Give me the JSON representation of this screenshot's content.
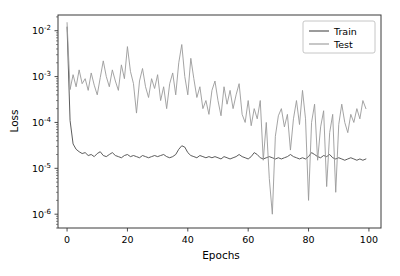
{
  "figure": {
    "background_color": "#ffffff",
    "plot_area": {
      "left": 58,
      "top": 15,
      "right": 381,
      "bottom": 228
    }
  },
  "chart_data": {
    "type": "line",
    "title": "",
    "xlabel": "Epochs",
    "ylabel": "Loss",
    "yscale": "log",
    "xscale": "linear",
    "xlim": [
      -3,
      104
    ],
    "ylim": [
      5e-07,
      0.022
    ],
    "grid": false,
    "legend_position": "upper right",
    "xticks": [
      0,
      20,
      40,
      60,
      80,
      100
    ],
    "xtick_labels": [
      "0",
      "20",
      "40",
      "60",
      "80",
      "100"
    ],
    "yticks": [
      0.01,
      0.001,
      0.0001,
      1e-05,
      1e-06
    ],
    "ytick_labels": [
      "10−2",
      "10−3",
      "10−4",
      "10−5",
      "10−6"
    ],
    "ytick_mantissas": [
      "10",
      "10",
      "10",
      "10",
      "10"
    ],
    "ytick_exponents": [
      "-2",
      "-3",
      "-4",
      "-5",
      "-6"
    ],
    "series": [
      {
        "name": "Train",
        "color": "#4a4a4a",
        "linewidth": 0.9,
        "x": [
          0,
          1,
          2,
          3,
          4,
          5,
          6,
          7,
          8,
          9,
          10,
          11,
          12,
          13,
          14,
          15,
          16,
          17,
          18,
          19,
          20,
          21,
          22,
          23,
          24,
          25,
          26,
          27,
          28,
          29,
          30,
          31,
          32,
          33,
          34,
          35,
          36,
          37,
          38,
          39,
          40,
          41,
          42,
          43,
          44,
          45,
          46,
          47,
          48,
          49,
          50,
          51,
          52,
          53,
          54,
          55,
          56,
          57,
          58,
          59,
          60,
          61,
          62,
          63,
          64,
          65,
          66,
          67,
          68,
          69,
          70,
          71,
          72,
          73,
          74,
          75,
          76,
          77,
          78,
          79,
          80,
          81,
          82,
          83,
          84,
          85,
          86,
          87,
          88,
          89,
          90,
          91,
          92,
          93,
          94,
          95,
          96,
          97,
          98,
          99
        ],
        "values": [
          0.012,
          0.00011,
          3.4e-05,
          2.6e-05,
          2.3e-05,
          2.1e-05,
          2.2e-05,
          1.9e-05,
          2e-05,
          1.8e-05,
          2.1e-05,
          2.3e-05,
          1.9e-05,
          1.8e-05,
          2e-05,
          2.2e-05,
          1.9e-05,
          1.8e-05,
          1.7e-05,
          1.9e-05,
          2e-05,
          1.8e-05,
          1.9e-05,
          1.8e-05,
          1.7e-05,
          1.9e-05,
          1.8e-05,
          1.7e-05,
          1.8e-05,
          1.9e-05,
          1.8e-05,
          1.9e-05,
          2e-05,
          1.8e-05,
          1.7e-05,
          1.8e-05,
          2e-05,
          2.6e-05,
          3.1e-05,
          2.9e-05,
          2.2e-05,
          1.9e-05,
          1.8e-05,
          1.7e-05,
          1.9e-05,
          1.8e-05,
          1.7e-05,
          1.8e-05,
          1.7e-05,
          1.8e-05,
          1.7e-05,
          1.6e-05,
          1.8e-05,
          1.7e-05,
          1.6e-05,
          1.7e-05,
          1.8e-05,
          2e-05,
          1.8e-05,
          1.7e-05,
          1.6e-05,
          1.8e-05,
          2.2e-05,
          2e-05,
          1.7e-05,
          1.6e-05,
          1.7e-05,
          1.8e-05,
          1.7e-05,
          1.6e-05,
          1.7e-05,
          1.6e-05,
          1.7e-05,
          1.8e-05,
          2e-05,
          1.8e-05,
          1.7e-05,
          1.6e-05,
          1.7e-05,
          1.6e-05,
          1.8e-05,
          2.2e-05,
          2e-05,
          1.8e-05,
          1.7e-05,
          1.9e-05,
          1.8e-05,
          2e-05,
          1.7e-05,
          1.6e-05,
          1.7e-05,
          1.6e-05,
          1.5e-05,
          1.6e-05,
          1.7e-05,
          1.6e-05,
          1.5e-05,
          1.6e-05,
          1.5e-05,
          1.6e-05
        ]
      },
      {
        "name": "Test",
        "color": "#9a9a9a",
        "linewidth": 0.9,
        "x": [
          0,
          1,
          2,
          3,
          4,
          5,
          6,
          7,
          8,
          9,
          10,
          11,
          12,
          13,
          14,
          15,
          16,
          17,
          18,
          19,
          20,
          21,
          22,
          23,
          24,
          25,
          26,
          27,
          28,
          29,
          30,
          31,
          32,
          33,
          34,
          35,
          36,
          37,
          38,
          39,
          40,
          41,
          42,
          43,
          44,
          45,
          46,
          47,
          48,
          49,
          50,
          51,
          52,
          53,
          54,
          55,
          56,
          57,
          58,
          59,
          60,
          61,
          62,
          63,
          64,
          65,
          66,
          67,
          68,
          69,
          70,
          71,
          72,
          73,
          74,
          75,
          76,
          77,
          78,
          79,
          80,
          81,
          82,
          83,
          84,
          85,
          86,
          87,
          88,
          89,
          90,
          91,
          92,
          93,
          94,
          95,
          96,
          97,
          98,
          99
        ],
        "values": [
          0.015,
          0.00052,
          0.0011,
          0.0006,
          0.0014,
          0.0007,
          0.0009,
          0.0005,
          0.0012,
          0.00065,
          0.0004,
          0.00095,
          0.0022,
          0.001,
          0.0006,
          0.0014,
          0.0008,
          0.0005,
          0.0018,
          0.0009,
          0.0045,
          0.0013,
          0.0007,
          0.00016,
          0.0008,
          0.0015,
          0.0006,
          0.00035,
          0.0009,
          0.00055,
          0.0011,
          0.0003,
          0.0006,
          0.0002,
          0.0007,
          0.0012,
          0.0004,
          0.002,
          0.005,
          0.001,
          0.0004,
          0.0025,
          0.0009,
          0.00035,
          0.0006,
          0.0002,
          0.0003,
          0.00015,
          0.0005,
          0.0008,
          0.0003,
          0.00014,
          0.0006,
          0.00025,
          0.0005,
          0.0002,
          0.0004,
          0.0007,
          0.00015,
          0.0001,
          0.0003,
          8.5e-05,
          0.0002,
          0.00012,
          0.0003,
          1.5e-05,
          0.0001,
          6e-06,
          1e-06,
          5e-05,
          0.00014,
          0.0002,
          8e-05,
          0.00015,
          2.5e-05,
          0.00012,
          0.0003,
          9e-05,
          0.0005,
          0.00012,
          2e-06,
          0.0001,
          0.00025,
          1.5e-05,
          8e-05,
          0.00018,
          4e-06,
          6e-05,
          0.00015,
          3e-06,
          9e-05,
          0.00025,
          0.0001,
          6e-05,
          0.00015,
          0.0001,
          0.0002,
          0.00012,
          0.0003,
          0.0002
        ]
      }
    ]
  },
  "legend": {
    "entries": [
      {
        "label": "Train",
        "color": "#4a4a4a"
      },
      {
        "label": "Test",
        "color": "#9a9a9a"
      }
    ]
  }
}
